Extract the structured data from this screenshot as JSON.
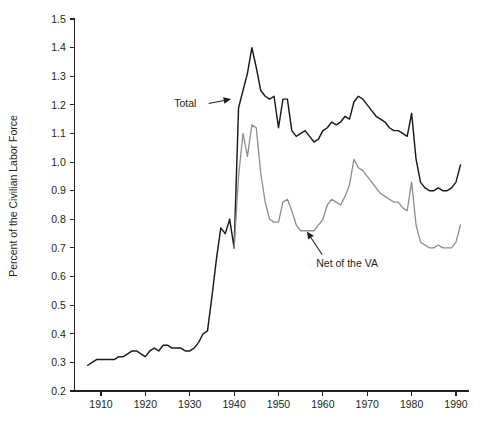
{
  "chart_data": {
    "type": "line",
    "title": "",
    "subtitle": "",
    "xlabel": "",
    "ylabel": "Percent of the Civilian Labor Force",
    "xlim": [
      1905,
      1993
    ],
    "ylim": [
      0.2,
      1.5
    ],
    "grid": false,
    "legend_position": "inline-annotations",
    "x_ticks": [
      1910,
      1920,
      1930,
      1940,
      1950,
      1960,
      1970,
      1980,
      1990
    ],
    "x_tick_labels": [
      "1910",
      "1920",
      "1930",
      "1940",
      "1950",
      "1960",
      "1970",
      "1980",
      "1990"
    ],
    "y_ticks": [
      0.2,
      0.3,
      0.4,
      0.5,
      0.6,
      0.7,
      0.8,
      0.9,
      1.0,
      1.1,
      1.2,
      1.3,
      1.4,
      1.5
    ],
    "y_tick_labels": [
      "0.2",
      "0.3",
      "0.4",
      "0.5",
      "0.6",
      "0.7",
      "0.8",
      "0.9",
      "1.0",
      "1.1",
      "1.2",
      "1.3",
      "1.4",
      "1.5"
    ],
    "annotations": [
      {
        "text": "Total",
        "target_year": 1940,
        "target_value": 1.22,
        "label_x": 1926.5,
        "label_y": 1.205
      },
      {
        "text": "Net of the VA",
        "target_year": 1955.5,
        "target_value": 0.775,
        "label_x": 1958.5,
        "label_y": 0.648
      }
    ],
    "series": [
      {
        "name": "Total",
        "color": "#1a1a1a",
        "x": [
          1907,
          1908,
          1909,
          1910,
          1911,
          1912,
          1913,
          1914,
          1915,
          1916,
          1917,
          1918,
          1919,
          1920,
          1921,
          1922,
          1923,
          1924,
          1925,
          1926,
          1927,
          1928,
          1929,
          1930,
          1931,
          1932,
          1933,
          1934,
          1935,
          1936,
          1937,
          1938,
          1939,
          1940,
          1941,
          1942,
          1943,
          1944,
          1945,
          1946,
          1947,
          1948,
          1949,
          1950,
          1951,
          1952,
          1953,
          1954,
          1955,
          1956,
          1957,
          1958,
          1959,
          1960,
          1961,
          1962,
          1963,
          1964,
          1965,
          1966,
          1967,
          1968,
          1969,
          1970,
          1971,
          1972,
          1973,
          1974,
          1975,
          1976,
          1977,
          1978,
          1979,
          1980,
          1981,
          1982,
          1983,
          1984,
          1985,
          1986,
          1987,
          1988,
          1989,
          1990,
          1991
        ],
        "values": [
          0.29,
          0.3,
          0.31,
          0.31,
          0.31,
          0.31,
          0.31,
          0.32,
          0.32,
          0.33,
          0.34,
          0.34,
          0.33,
          0.32,
          0.34,
          0.35,
          0.34,
          0.36,
          0.36,
          0.35,
          0.35,
          0.35,
          0.34,
          0.34,
          0.35,
          0.37,
          0.4,
          0.41,
          0.53,
          0.66,
          0.77,
          0.75,
          0.8,
          0.7,
          1.19,
          1.25,
          1.31,
          1.4,
          1.33,
          1.25,
          1.23,
          1.22,
          1.23,
          1.12,
          1.22,
          1.22,
          1.11,
          1.09,
          1.1,
          1.11,
          1.09,
          1.07,
          1.08,
          1.11,
          1.12,
          1.14,
          1.13,
          1.14,
          1.16,
          1.15,
          1.21,
          1.23,
          1.22,
          1.2,
          1.18,
          1.16,
          1.15,
          1.14,
          1.12,
          1.11,
          1.11,
          1.1,
          1.09,
          1.17,
          1.01,
          0.93,
          0.91,
          0.9,
          0.9,
          0.91,
          0.9,
          0.9,
          0.91,
          0.93,
          0.99
        ]
      },
      {
        "name": "Net of the VA",
        "color": "#8d8d8d",
        "x": [
          1940,
          1941,
          1942,
          1943,
          1944,
          1945,
          1946,
          1947,
          1948,
          1949,
          1950,
          1951,
          1952,
          1953,
          1954,
          1955,
          1956,
          1957,
          1958,
          1959,
          1960,
          1961,
          1962,
          1963,
          1964,
          1965,
          1966,
          1967,
          1968,
          1969,
          1970,
          1971,
          1972,
          1973,
          1974,
          1975,
          1976,
          1977,
          1978,
          1979,
          1980,
          1981,
          1982,
          1983,
          1984,
          1985,
          1986,
          1987,
          1988,
          1989,
          1990,
          1991
        ],
        "values": [
          0.7,
          0.95,
          1.1,
          1.02,
          1.13,
          1.12,
          0.96,
          0.86,
          0.8,
          0.79,
          0.79,
          0.86,
          0.87,
          0.83,
          0.78,
          0.76,
          0.76,
          0.76,
          0.76,
          0.78,
          0.8,
          0.85,
          0.87,
          0.86,
          0.85,
          0.88,
          0.92,
          1.01,
          0.98,
          0.97,
          0.95,
          0.93,
          0.91,
          0.89,
          0.88,
          0.87,
          0.86,
          0.86,
          0.84,
          0.83,
          0.93,
          0.78,
          0.72,
          0.71,
          0.7,
          0.7,
          0.71,
          0.7,
          0.7,
          0.7,
          0.72,
          0.78
        ]
      }
    ]
  }
}
